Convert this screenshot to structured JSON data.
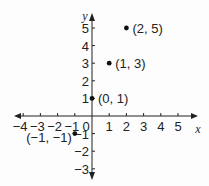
{
  "chart_data": {
    "type": "scatter",
    "title": "",
    "xlabel": "x",
    "ylabel": "y",
    "xlim": [
      -4,
      5
    ],
    "ylim": [
      -3,
      5
    ],
    "grid": false,
    "x_ticks": [
      -4,
      -3,
      -2,
      -1,
      0,
      1,
      2,
      3,
      4,
      5
    ],
    "y_ticks": [
      -3,
      -2,
      -1,
      1,
      2,
      3,
      4,
      5
    ],
    "x_tick_labels": [
      "−4",
      "−3",
      "−2",
      "−1",
      "0",
      "1",
      "2",
      "3",
      "4",
      "5"
    ],
    "y_tick_labels": [
      "−3",
      "−2",
      "−1",
      "1",
      "2",
      "3",
      "4",
      "5"
    ],
    "points": [
      {
        "x": -1,
        "y": -1,
        "label": "(−1, −1)"
      },
      {
        "x": 0,
        "y": 1,
        "label": "(0, 1)"
      },
      {
        "x": 1,
        "y": 3,
        "label": "(1, 3)"
      },
      {
        "x": 2,
        "y": 5,
        "label": "(2, 5)"
      }
    ],
    "series": [
      {
        "name": "points",
        "x": [
          -1,
          0,
          1,
          2
        ],
        "y": [
          -1,
          1,
          3,
          5
        ]
      }
    ]
  },
  "axes": {
    "x_name": "x",
    "y_name": "y",
    "color": "#222222"
  }
}
